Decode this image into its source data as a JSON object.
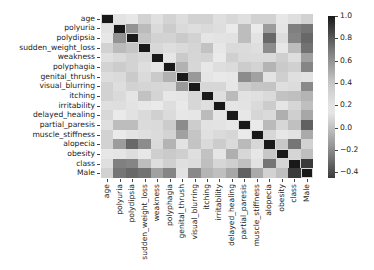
{
  "chart_data": {
    "type": "heatmap",
    "title": "",
    "xlabel": "",
    "ylabel": "",
    "labels": [
      "age",
      "polyuria",
      "polydipsia",
      "sudden_weight_loss",
      "weakness",
      "polyphagia",
      "genital_thrush",
      "visual_blurring",
      "itching",
      "irritability",
      "delayed_healing",
      "partial_paresis",
      "muscle_stiffness",
      "alopecia",
      "obesity",
      "class",
      "Male"
    ],
    "matrix": [
      [
        1.0,
        0.2,
        0.14,
        0.06,
        0.22,
        0.32,
        0.1,
        0.33,
        0.33,
        0.11,
        0.28,
        0.23,
        0.33,
        0.33,
        0.14,
        0.11,
        0.06
      ],
      [
        0.2,
        1.0,
        0.6,
        0.45,
        0.27,
        0.37,
        0.09,
        0.24,
        0.09,
        0.24,
        0.15,
        0.44,
        0.15,
        -0.14,
        0.13,
        0.67,
        -0.27
      ],
      [
        0.14,
        0.6,
        1.0,
        0.41,
        0.33,
        0.32,
        0.03,
        0.33,
        0.13,
        0.2,
        0.12,
        0.44,
        0.2,
        -0.31,
        0.1,
        0.65,
        -0.31
      ],
      [
        0.06,
        0.45,
        0.41,
        1.0,
        0.28,
        0.24,
        0.09,
        0.07,
        -0.0,
        0.14,
        0.09,
        0.26,
        0.11,
        -0.2,
        0.17,
        0.44,
        -0.28
      ],
      [
        0.22,
        0.27,
        0.33,
        0.28,
        1.0,
        0.18,
        0.03,
        0.3,
        0.31,
        0.15,
        0.34,
        0.27,
        0.26,
        0.09,
        0.05,
        0.24,
        -0.12
      ],
      [
        0.32,
        0.37,
        0.32,
        0.24,
        0.18,
        1.0,
        -0.06,
        0.29,
        0.14,
        0.24,
        0.26,
        0.37,
        0.32,
        -0.05,
        0.03,
        0.34,
        -0.22
      ],
      [
        0.1,
        0.09,
        0.03,
        0.09,
        0.03,
        -0.06,
        1.0,
        -0.15,
        0.13,
        0.16,
        0.14,
        -0.2,
        -0.12,
        0.2,
        0.05,
        0.11,
        0.21
      ],
      [
        0.33,
        0.24,
        0.33,
        0.07,
        0.3,
        0.29,
        -0.15,
        1.0,
        0.29,
        0.08,
        0.18,
        0.36,
        0.41,
        0.01,
        0.11,
        0.25,
        -0.21
      ],
      [
        0.33,
        0.09,
        0.13,
        -0.0,
        0.31,
        0.14,
        0.13,
        0.29,
        1.0,
        0.11,
        0.45,
        0.12,
        0.22,
        0.27,
        0.0,
        -0.01,
        -0.05
      ],
      [
        0.11,
        0.24,
        0.2,
        0.14,
        0.15,
        0.24,
        0.16,
        0.08,
        0.11,
        1.0,
        0.13,
        0.2,
        0.09,
        0.04,
        0.13,
        0.3,
        -0.01
      ],
      [
        0.28,
        0.15,
        0.12,
        0.09,
        0.34,
        0.26,
        0.14,
        0.18,
        0.45,
        0.13,
        1.0,
        0.17,
        0.3,
        0.27,
        -0.07,
        0.05,
        -0.1
      ],
      [
        0.23,
        0.44,
        0.44,
        0.26,
        0.27,
        0.37,
        -0.2,
        0.36,
        0.12,
        0.2,
        0.17,
        1.0,
        0.15,
        -0.03,
        0.08,
        0.43,
        -0.33
      ],
      [
        0.33,
        0.15,
        0.2,
        0.11,
        0.26,
        0.32,
        -0.12,
        0.41,
        0.22,
        0.09,
        0.3,
        0.15,
        1.0,
        0.08,
        0.14,
        0.12,
        -0.09
      ],
      [
        0.33,
        -0.14,
        -0.31,
        -0.2,
        0.09,
        -0.05,
        0.2,
        0.01,
        0.27,
        0.04,
        0.27,
        -0.03,
        0.08,
        1.0,
        0.02,
        -0.27,
        0.33
      ],
      [
        0.14,
        0.13,
        0.1,
        0.17,
        0.05,
        0.03,
        0.05,
        0.11,
        0.0,
        0.13,
        -0.07,
        0.08,
        0.14,
        0.02,
        1.0,
        0.07,
        -0.01
      ],
      [
        0.11,
        0.67,
        0.65,
        0.44,
        0.24,
        0.34,
        0.11,
        0.25,
        -0.01,
        0.3,
        0.05,
        0.43,
        0.12,
        -0.27,
        0.07,
        1.0,
        -0.45
      ],
      [
        0.06,
        -0.27,
        -0.31,
        -0.28,
        -0.12,
        -0.22,
        0.21,
        -0.21,
        -0.05,
        -0.01,
        -0.1,
        -0.33,
        -0.09,
        0.33,
        -0.01,
        -0.45,
        1.0
      ]
    ],
    "colorbar": {
      "ticks": [
        "1.0",
        "0.8",
        "0.6",
        "0.4",
        "0.2",
        "0.0",
        "−0.2",
        "−0.4"
      ],
      "tick_values": [
        1.0,
        0.8,
        0.6,
        0.4,
        0.2,
        0.0,
        -0.2,
        -0.4
      ],
      "range": [
        -0.45,
        1.0
      ]
    },
    "grid": false,
    "legend_position": "right (colorbar)"
  }
}
